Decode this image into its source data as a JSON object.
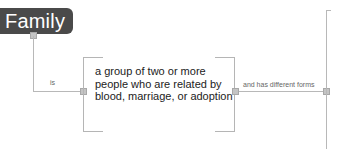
{
  "nodes": {
    "family": {
      "label": "Family"
    },
    "definition": {
      "text": "a group of two or more people who are related by blood, marriage, or adoption"
    }
  },
  "links": {
    "is": {
      "label": "is"
    },
    "different_forms": {
      "label": "and has different forms"
    }
  },
  "colors": {
    "node_fill": "#4a4a4a",
    "node_text": "#ffffff",
    "connector": "#b8b8b8",
    "text": "#222222"
  }
}
